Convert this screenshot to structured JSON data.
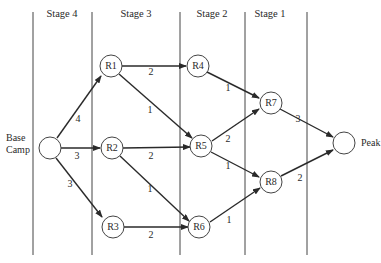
{
  "stages": [
    {
      "label": "Stage 4"
    },
    {
      "label": "Stage 3"
    },
    {
      "label": "Stage 2"
    },
    {
      "label": "Stage 1"
    }
  ],
  "nodes": {
    "base": {
      "label_line1": "Base",
      "label_line2": "Camp"
    },
    "R1": {
      "label": "R1"
    },
    "R2": {
      "label": "R2"
    },
    "R3": {
      "label": "R3"
    },
    "R4": {
      "label": "R4"
    },
    "R5": {
      "label": "R5"
    },
    "R6": {
      "label": "R6"
    },
    "R7": {
      "label": "R7"
    },
    "R8": {
      "label": "R8"
    },
    "peak": {
      "label": "Peak"
    }
  },
  "edges": [
    {
      "from": "Base Camp",
      "to": "R1",
      "weight": "4"
    },
    {
      "from": "Base Camp",
      "to": "R2",
      "weight": "3"
    },
    {
      "from": "Base Camp",
      "to": "R3",
      "weight": "3"
    },
    {
      "from": "R1",
      "to": "R4",
      "weight": "2"
    },
    {
      "from": "R1",
      "to": "R5",
      "weight": "1"
    },
    {
      "from": "R2",
      "to": "R5",
      "weight": "2"
    },
    {
      "from": "R2",
      "to": "R6",
      "weight": "1"
    },
    {
      "from": "R3",
      "to": "R6",
      "weight": "2"
    },
    {
      "from": "R4",
      "to": "R7",
      "weight": "1"
    },
    {
      "from": "R5",
      "to": "R7",
      "weight": "2"
    },
    {
      "from": "R5",
      "to": "R8",
      "weight": "1"
    },
    {
      "from": "R6",
      "to": "R8",
      "weight": "1"
    },
    {
      "from": "R7",
      "to": "Peak",
      "weight": "3"
    },
    {
      "from": "R8",
      "to": "Peak",
      "weight": "2"
    }
  ]
}
